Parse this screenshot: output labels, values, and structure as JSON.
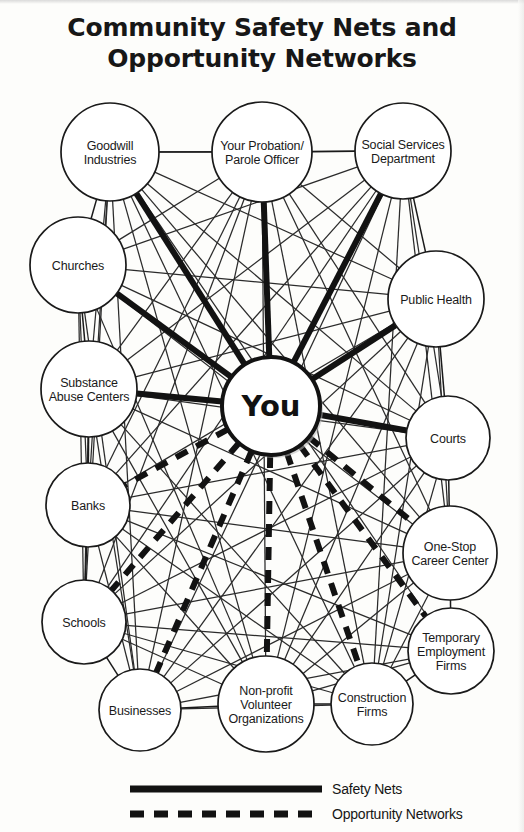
{
  "title": {
    "line1": "Community Safety Nets and",
    "line2": "Opportunity Networks"
  },
  "center_node": {
    "id": "you",
    "label": "You",
    "cx": 271,
    "cy": 406,
    "r": 49
  },
  "nodes": [
    {
      "id": "goodwill",
      "lines": [
        "Goodwill",
        "Industries"
      ],
      "cx": 110,
      "cy": 152,
      "r": 49
    },
    {
      "id": "probation",
      "lines": [
        "Your Probation/",
        "Parole Officer"
      ],
      "cx": 262,
      "cy": 152,
      "r": 50
    },
    {
      "id": "social",
      "lines": [
        "Social Services",
        "Department"
      ],
      "cx": 403,
      "cy": 151,
      "r": 48
    },
    {
      "id": "churches",
      "lines": [
        "Churches"
      ],
      "cx": 78,
      "cy": 265,
      "r": 48
    },
    {
      "id": "publichealth",
      "lines": [
        "Public Health"
      ],
      "cx": 436,
      "cy": 299,
      "r": 48
    },
    {
      "id": "substance",
      "lines": [
        "Substance",
        "Abuse Centers"
      ],
      "cx": 89,
      "cy": 389,
      "r": 48
    },
    {
      "id": "courts",
      "lines": [
        "Courts"
      ],
      "cx": 448,
      "cy": 438,
      "r": 42
    },
    {
      "id": "banks",
      "lines": [
        "Banks"
      ],
      "cx": 88,
      "cy": 505,
      "r": 42
    },
    {
      "id": "onestop",
      "lines": [
        "One-Stop",
        "Career Center"
      ],
      "cx": 450,
      "cy": 553,
      "r": 47
    },
    {
      "id": "schools",
      "lines": [
        "Schools"
      ],
      "cx": 84,
      "cy": 622,
      "r": 42
    },
    {
      "id": "temporary",
      "lines": [
        "Temporary",
        "Employment",
        "Firms"
      ],
      "cx": 451,
      "cy": 651,
      "r": 43
    },
    {
      "id": "businesses",
      "lines": [
        "Businesses"
      ],
      "cx": 140,
      "cy": 710,
      "r": 41
    },
    {
      "id": "nonprofit",
      "lines": [
        "Non-profit",
        "Volunteer",
        "Organizations"
      ],
      "cx": 266,
      "cy": 704,
      "r": 48
    },
    {
      "id": "construction",
      "lines": [
        "Construction",
        "Firms"
      ],
      "cx": 372,
      "cy": 704,
      "r": 41
    }
  ],
  "safety_net_edges": [
    {
      "from": "you",
      "to": "goodwill"
    },
    {
      "from": "you",
      "to": "probation"
    },
    {
      "from": "you",
      "to": "social"
    },
    {
      "from": "you",
      "to": "substance"
    },
    {
      "from": "you",
      "to": "publichealth"
    },
    {
      "from": "you",
      "to": "courts"
    },
    {
      "from": "you",
      "to": "churches"
    }
  ],
  "opportunity_edges": [
    {
      "from": "you",
      "to": "banks"
    },
    {
      "from": "you",
      "to": "schools"
    },
    {
      "from": "you",
      "to": "businesses"
    },
    {
      "from": "you",
      "to": "nonprofit"
    },
    {
      "from": "you",
      "to": "construction"
    },
    {
      "from": "you",
      "to": "temporary"
    },
    {
      "from": "you",
      "to": "onestop"
    }
  ],
  "ring_edges": [
    {
      "from": "goodwill",
      "to": "probation"
    },
    {
      "from": "probation",
      "to": "social"
    },
    {
      "from": "goodwill",
      "to": "churches"
    },
    {
      "from": "social",
      "to": "publichealth"
    },
    {
      "from": "churches",
      "to": "substance"
    },
    {
      "from": "publichealth",
      "to": "courts"
    },
    {
      "from": "substance",
      "to": "banks"
    },
    {
      "from": "courts",
      "to": "onestop"
    },
    {
      "from": "banks",
      "to": "schools"
    },
    {
      "from": "onestop",
      "to": "temporary"
    },
    {
      "from": "schools",
      "to": "businesses"
    },
    {
      "from": "temporary",
      "to": "construction"
    },
    {
      "from": "businesses",
      "to": "nonprofit"
    },
    {
      "from": "nonprofit",
      "to": "construction"
    }
  ],
  "mesh_edges": [
    {
      "from": "goodwill",
      "to": "social"
    },
    {
      "from": "goodwill",
      "to": "publichealth"
    },
    {
      "from": "goodwill",
      "to": "courts"
    },
    {
      "from": "goodwill",
      "to": "onestop"
    },
    {
      "from": "goodwill",
      "to": "nonprofit"
    },
    {
      "from": "goodwill",
      "to": "businesses"
    },
    {
      "from": "goodwill",
      "to": "construction"
    },
    {
      "from": "goodwill",
      "to": "temporary"
    },
    {
      "from": "goodwill",
      "to": "substance"
    },
    {
      "from": "goodwill",
      "to": "banks"
    },
    {
      "from": "goodwill",
      "to": "schools"
    },
    {
      "from": "probation",
      "to": "churches"
    },
    {
      "from": "probation",
      "to": "publichealth"
    },
    {
      "from": "probation",
      "to": "substance"
    },
    {
      "from": "probation",
      "to": "courts"
    },
    {
      "from": "probation",
      "to": "banks"
    },
    {
      "from": "probation",
      "to": "onestop"
    },
    {
      "from": "probation",
      "to": "schools"
    },
    {
      "from": "probation",
      "to": "nonprofit"
    },
    {
      "from": "probation",
      "to": "construction"
    },
    {
      "from": "probation",
      "to": "businesses"
    },
    {
      "from": "social",
      "to": "churches"
    },
    {
      "from": "social",
      "to": "substance"
    },
    {
      "from": "social",
      "to": "banks"
    },
    {
      "from": "social",
      "to": "schools"
    },
    {
      "from": "social",
      "to": "businesses"
    },
    {
      "from": "social",
      "to": "nonprofit"
    },
    {
      "from": "social",
      "to": "construction"
    },
    {
      "from": "social",
      "to": "onestop"
    },
    {
      "from": "social",
      "to": "courts"
    },
    {
      "from": "churches",
      "to": "publichealth"
    },
    {
      "from": "churches",
      "to": "courts"
    },
    {
      "from": "churches",
      "to": "onestop"
    },
    {
      "from": "churches",
      "to": "nonprofit"
    },
    {
      "from": "churches",
      "to": "businesses"
    },
    {
      "from": "churches",
      "to": "banks"
    },
    {
      "from": "churches",
      "to": "schools"
    },
    {
      "from": "publichealth",
      "to": "substance"
    },
    {
      "from": "publichealth",
      "to": "banks"
    },
    {
      "from": "publichealth",
      "to": "schools"
    },
    {
      "from": "publichealth",
      "to": "nonprofit"
    },
    {
      "from": "publichealth",
      "to": "businesses"
    },
    {
      "from": "publichealth",
      "to": "construction"
    },
    {
      "from": "publichealth",
      "to": "onestop"
    },
    {
      "from": "substance",
      "to": "courts"
    },
    {
      "from": "substance",
      "to": "onestop"
    },
    {
      "from": "substance",
      "to": "nonprofit"
    },
    {
      "from": "substance",
      "to": "businesses"
    },
    {
      "from": "substance",
      "to": "schools"
    },
    {
      "from": "substance",
      "to": "construction"
    },
    {
      "from": "courts",
      "to": "banks"
    },
    {
      "from": "courts",
      "to": "schools"
    },
    {
      "from": "courts",
      "to": "nonprofit"
    },
    {
      "from": "courts",
      "to": "businesses"
    },
    {
      "from": "courts",
      "to": "construction"
    },
    {
      "from": "banks",
      "to": "onestop"
    },
    {
      "from": "banks",
      "to": "nonprofit"
    },
    {
      "from": "banks",
      "to": "construction"
    },
    {
      "from": "banks",
      "to": "temporary"
    },
    {
      "from": "banks",
      "to": "businesses"
    },
    {
      "from": "onestop",
      "to": "schools"
    },
    {
      "from": "onestop",
      "to": "businesses"
    },
    {
      "from": "onestop",
      "to": "nonprofit"
    },
    {
      "from": "onestop",
      "to": "construction"
    },
    {
      "from": "schools",
      "to": "nonprofit"
    },
    {
      "from": "schools",
      "to": "construction"
    },
    {
      "from": "schools",
      "to": "temporary"
    },
    {
      "from": "temporary",
      "to": "businesses"
    },
    {
      "from": "temporary",
      "to": "nonprofit"
    },
    {
      "from": "businesses",
      "to": "construction"
    }
  ],
  "legend": {
    "items": [
      {
        "id": "safety-nets",
        "label": "Safety Nets",
        "style": "solid"
      },
      {
        "id": "opportunity-networks",
        "label": "Opportunity Networks",
        "style": "dashed"
      }
    ],
    "swatch": {
      "x1": 130,
      "x2": 322,
      "solid_y": 789,
      "dashed_y": 814,
      "label_x": 332
    }
  },
  "colors": {
    "ink": "#1a1a1a",
    "heavy_ink": "#121212",
    "thin_ink": "#2b2b2b",
    "page": "#fdfdfb",
    "node_fill": "#ffffff"
  }
}
